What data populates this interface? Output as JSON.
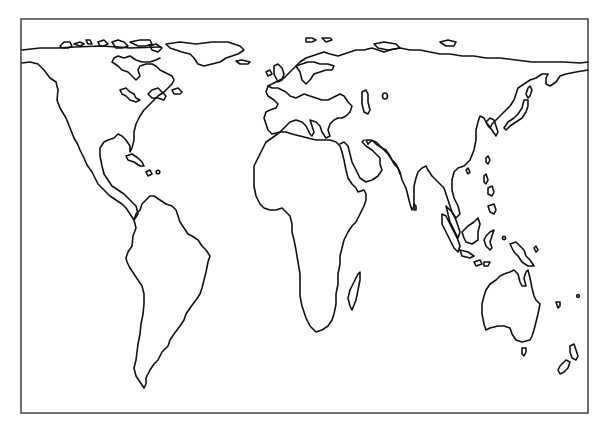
{
  "map": {
    "type": "outline world map",
    "projection_style": "equal-area (Peters-like)",
    "background_color": "#ffffff",
    "stroke_color": "#111111",
    "frame_color": "#333333",
    "frame": {
      "x": 21,
      "y": 19,
      "width": 567,
      "height": 394
    },
    "labels": [],
    "regions": [
      {
        "id": "north-america",
        "name": "North America"
      },
      {
        "id": "greenland",
        "name": "Greenland"
      },
      {
        "id": "arctic-islands",
        "name": "Arctic Archipelago"
      },
      {
        "id": "caribbean",
        "name": "Caribbean Islands"
      },
      {
        "id": "south-america",
        "name": "South America"
      },
      {
        "id": "europe-asia",
        "name": "Eurasia"
      },
      {
        "id": "british-isles",
        "name": "British Isles"
      },
      {
        "id": "iceland",
        "name": "Iceland"
      },
      {
        "id": "africa",
        "name": "Africa"
      },
      {
        "id": "arabia",
        "name": "Arabian Peninsula"
      },
      {
        "id": "madagascar",
        "name": "Madagascar"
      },
      {
        "id": "japan",
        "name": "Japan"
      },
      {
        "id": "southeast-asia",
        "name": "Southeast Asia"
      },
      {
        "id": "indonesia",
        "name": "Indonesia"
      },
      {
        "id": "new-guinea",
        "name": "New Guinea"
      },
      {
        "id": "australia",
        "name": "Australia"
      },
      {
        "id": "tasmania",
        "name": "Tasmania"
      },
      {
        "id": "new-zealand",
        "name": "New Zealand"
      },
      {
        "id": "pacific-islands",
        "name": "Pacific Islands"
      }
    ]
  }
}
